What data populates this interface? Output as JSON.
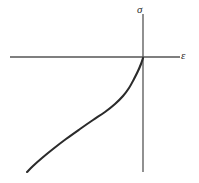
{
  "figure": {
    "kind": "stress-strain-curve",
    "background_color": "#ffffff",
    "axis_color": "#555555",
    "curve_color": "#2b2b2b"
  },
  "labels": {
    "vertical_axis": "σ",
    "horizontal_axis": "ε"
  },
  "chart_data": {
    "type": "line",
    "title": "",
    "xlabel": "ε",
    "ylabel": "σ",
    "grid": false,
    "legend": null,
    "axes": {
      "origin_px": [
        143,
        57
      ],
      "horizontal_axis_px": {
        "x1": 10,
        "y1": 57,
        "x2": 180,
        "y2": 57
      },
      "vertical_axis_px": {
        "x1": 143,
        "y1": 14,
        "x2": 143,
        "y2": 172
      },
      "x_tick_labels": [],
      "y_tick_labels": [],
      "quadrant_shown": "third-quadrant-to-origin"
    },
    "series": [
      {
        "name": "stress-strain curve",
        "color": "#2b2b2b",
        "points_px": [
          [
            27,
            172
          ],
          [
            33,
            166
          ],
          [
            42,
            158
          ],
          [
            53,
            149
          ],
          [
            66,
            139
          ],
          [
            80,
            129
          ],
          [
            93,
            120
          ],
          [
            105,
            112
          ],
          [
            115,
            104
          ],
          [
            123,
            96
          ],
          [
            129,
            88
          ],
          [
            134,
            79
          ],
          [
            138,
            71
          ],
          [
            141,
            64
          ],
          [
            143,
            58
          ]
        ],
        "shape": "sigmoidal, concave rising steeply to the origin"
      }
    ]
  }
}
